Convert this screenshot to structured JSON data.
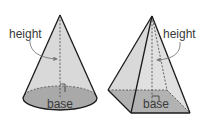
{
  "figures": [
    {
      "shape": "cone",
      "labels": {
        "height": "height",
        "base": "base"
      }
    },
    {
      "shape": "pyramid",
      "labels": {
        "height": "height",
        "base": "base"
      }
    }
  ],
  "colors": {
    "face_light": "#d9d9d9",
    "face_mid": "#c8c8c8",
    "base_fill": "#a9a9a9",
    "outline": "#1a1a1a",
    "dashed": "#555555",
    "arrow": "#777777",
    "text": "#3a3a3a"
  }
}
